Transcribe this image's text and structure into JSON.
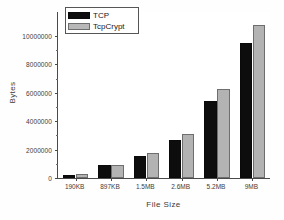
{
  "chart_data": {
    "type": "bar",
    "title": "",
    "xlabel": "File Size",
    "ylabel": "Bytes",
    "categories": [
      "190KB",
      "897KB",
      "1.5MB",
      "2.6MB",
      "5.2MB",
      "9MB"
    ],
    "series": [
      {
        "name": "TCP",
        "color": "#0d0d0d",
        "values": [
          200000,
          900000,
          1550000,
          2650000,
          5400000,
          9550000
        ]
      },
      {
        "name": "TcpCrypt",
        "color": "#b3b3b3",
        "values": [
          280000,
          900000,
          1750000,
          3100000,
          6250000,
          10750000
        ]
      }
    ],
    "ylim": [
      0,
      11700000
    ],
    "yticks": [
      0,
      2000000,
      4000000,
      6000000,
      8000000,
      10000000
    ],
    "ytick_labels": [
      "0",
      "2000000",
      "4000000",
      "6000000",
      "8000000",
      "10000000"
    ],
    "grid": false,
    "legend_position": "top-left"
  },
  "legend": {
    "entries": [
      {
        "label": "TCP"
      },
      {
        "label": "TcpCrypt"
      }
    ]
  },
  "axes": {
    "y_title": "Bytes",
    "x_title": "File Size"
  }
}
